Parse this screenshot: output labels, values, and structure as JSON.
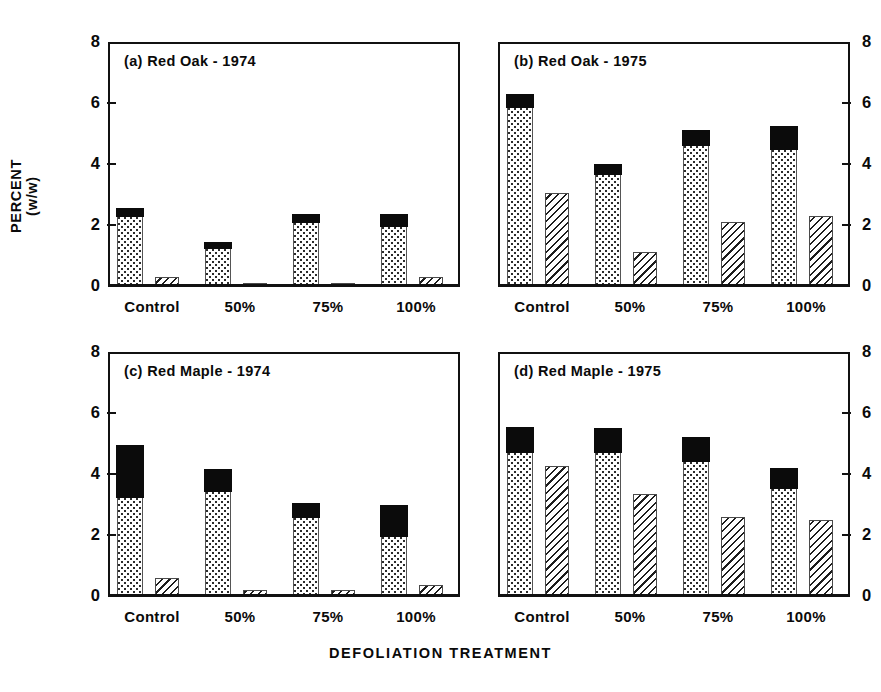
{
  "figure": {
    "ylabel": "PERCENT\n(w/w)",
    "xlabel": "DEFOLIATION TREATMENT",
    "caption_sliver": "  ",
    "categories": [
      "Control",
      "50%",
      "75%",
      "100%"
    ],
    "ytick_labels": [
      "0",
      "2",
      "4",
      "6",
      "8"
    ],
    "ytick_values": [
      0,
      2,
      4,
      6,
      8
    ],
    "ylim": [
      0,
      8
    ],
    "colors": {
      "ink": "#111111",
      "black_segment": "#0b0b0b",
      "background": "#ffffff"
    }
  },
  "panels": [
    {
      "id": "a",
      "title": "(a) Red Oak - 1974",
      "axis_side": "left",
      "tick_labels": [
        "0",
        "2",
        "4",
        "6",
        "8"
      ]
    },
    {
      "id": "b",
      "title": "(b) Red Oak - 1975",
      "axis_side": "right",
      "tick_labels": [
        "0",
        "2",
        "4",
        "6",
        "8"
      ]
    },
    {
      "id": "c",
      "title": "(c) Red Maple - 1974",
      "axis_side": "left",
      "tick_labels": [
        "0",
        "2",
        "4",
        "6",
        "8"
      ]
    },
    {
      "id": "d",
      "title": "(d) Red Maple - 1975",
      "axis_side": "right",
      "tick_labels": [
        "0",
        "2",
        "4",
        "6",
        "8"
      ]
    }
  ],
  "chart_data": {
    "type": "bar",
    "xlabel": "DEFOLIATION TREATMENT",
    "ylabel": "PERCENT (w/w)",
    "ylim": [
      0,
      8
    ],
    "yticks": [
      0,
      2,
      4,
      6,
      8
    ],
    "grid": false,
    "legend": "none",
    "categories": [
      "Control",
      "50%",
      "75%",
      "100%"
    ],
    "series_names": [
      "dotted-lower",
      "black-upper",
      "hatched"
    ],
    "panels": [
      {
        "id": "a",
        "label": "(a) Red Oak - 1974",
        "series": [
          {
            "name": "dotted-lower",
            "fill": "stipple",
            "values": [
              2.25,
              1.2,
              2.05,
              1.95
            ]
          },
          {
            "name": "black-upper",
            "fill": "solid-black",
            "values": [
              2.55,
              1.45,
              2.35,
              2.35
            ]
          },
          {
            "name": "hatched",
            "fill": "diagonal-hatch",
            "values": [
              0.3,
              0.1,
              0.1,
              0.3
            ]
          }
        ]
      },
      {
        "id": "b",
        "label": "(b) Red Oak - 1975",
        "series": [
          {
            "name": "dotted-lower",
            "fill": "stipple",
            "values": [
              5.85,
              3.65,
              4.6,
              4.45
            ]
          },
          {
            "name": "black-upper",
            "fill": "solid-black",
            "values": [
              6.3,
              4.0,
              5.1,
              5.25
            ]
          },
          {
            "name": "hatched",
            "fill": "diagonal-hatch",
            "values": [
              3.05,
              1.1,
              2.1,
              2.3
            ]
          }
        ]
      },
      {
        "id": "c",
        "label": "(c) Red Maple - 1974",
        "series": [
          {
            "name": "dotted-lower",
            "fill": "stipple",
            "values": [
              3.2,
              3.4,
              2.55,
              1.95
            ]
          },
          {
            "name": "black-upper",
            "fill": "solid-black",
            "values": [
              4.95,
              4.15,
              3.05,
              3.0
            ]
          },
          {
            "name": "hatched",
            "fill": "diagonal-hatch",
            "values": [
              0.6,
              0.2,
              0.2,
              0.35
            ]
          }
        ]
      },
      {
        "id": "d",
        "label": "(d) Red Maple - 1975",
        "series": [
          {
            "name": "dotted-lower",
            "fill": "stipple",
            "values": [
              4.7,
              4.7,
              4.4,
              3.5
            ]
          },
          {
            "name": "black-upper",
            "fill": "solid-black",
            "values": [
              5.55,
              5.5,
              5.2,
              4.2
            ]
          },
          {
            "name": "hatched",
            "fill": "diagonal-hatch",
            "values": [
              4.25,
              3.35,
              2.6,
              2.5
            ]
          }
        ]
      }
    ]
  }
}
